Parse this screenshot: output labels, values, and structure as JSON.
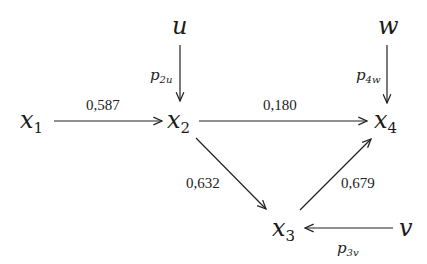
{
  "diagram": {
    "type": "path-diagram",
    "nodes": {
      "x1": {
        "base": "x",
        "sub": "1"
      },
      "x2": {
        "base": "x",
        "sub": "2"
      },
      "x3": {
        "base": "x",
        "sub": "3"
      },
      "x4": {
        "base": "x",
        "sub": "4"
      },
      "u": {
        "base": "u"
      },
      "w": {
        "base": "w"
      },
      "v": {
        "base": "v"
      }
    },
    "edges": [
      {
        "from": "x1",
        "to": "x2",
        "label": "0,587"
      },
      {
        "from": "x2",
        "to": "x4",
        "label": "0,180"
      },
      {
        "from": "x2",
        "to": "x3",
        "label": "0,632"
      },
      {
        "from": "x3",
        "to": "x4",
        "label": "0,679"
      },
      {
        "from": "u",
        "to": "x2",
        "label_base": "p",
        "label_sub": "2u"
      },
      {
        "from": "w",
        "to": "x4",
        "label_base": "p",
        "label_sub": "4w"
      },
      {
        "from": "v",
        "to": "x3",
        "label_base": "p",
        "label_sub": "3v"
      }
    ]
  }
}
